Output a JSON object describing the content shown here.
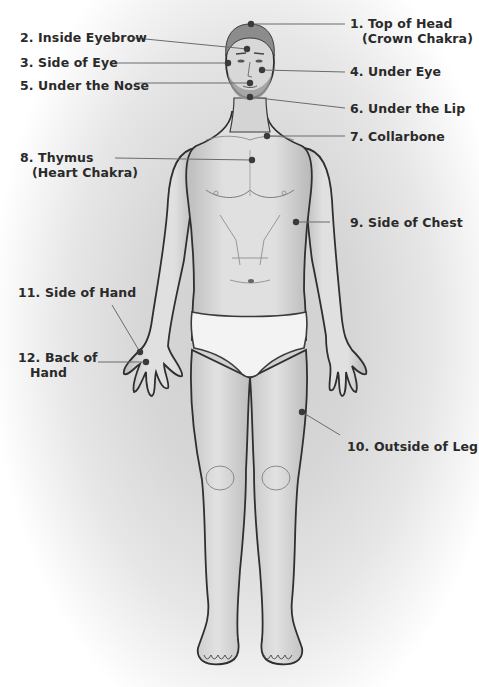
{
  "diagram": {
    "colors": {
      "line": "#6b6b6b",
      "dot": "#3a3a3a",
      "text": "#2a2a2a",
      "outline": "#2f2f2f",
      "skin": "#d9d9d9",
      "underwear": "#f2f2f2"
    },
    "points": [
      {
        "id": "top-of-head",
        "label": "1. Top of Head",
        "sub": "(Crown Chakra)",
        "side": "right",
        "label_x": 350,
        "label_y": 16,
        "dot_x": 251,
        "dot_y": 24,
        "line_to_x": 345,
        "line_to_y": 24
      },
      {
        "id": "inside-eyebrow",
        "label": "2. Inside Eyebrow",
        "sub": "",
        "side": "left",
        "label_x": 20,
        "label_y": 30,
        "dot_x": 247,
        "dot_y": 49,
        "line_from_x": 135,
        "line_from_y": 38
      },
      {
        "id": "side-of-eye",
        "label": "3. Side of Eye",
        "sub": "",
        "side": "left",
        "label_x": 20,
        "label_y": 55,
        "dot_x": 228,
        "dot_y": 63,
        "line_from_x": 110,
        "line_from_y": 63
      },
      {
        "id": "under-eye",
        "label": "4. Under Eye",
        "sub": "",
        "side": "right",
        "label_x": 350,
        "label_y": 64,
        "dot_x": 262,
        "dot_y": 70,
        "line_to_x": 345,
        "line_to_y": 72
      },
      {
        "id": "under-the-nose",
        "label": "5. Under the Nose",
        "sub": "",
        "side": "left",
        "label_x": 20,
        "label_y": 78,
        "dot_x": 250,
        "dot_y": 83,
        "line_from_x": 135,
        "line_from_y": 83
      },
      {
        "id": "under-the-lip",
        "label": "6. Under the Lip",
        "sub": "",
        "side": "right",
        "label_x": 350,
        "label_y": 101,
        "dot_x": 250,
        "dot_y": 97,
        "line_to_x": 345,
        "line_to_y": 108
      },
      {
        "id": "collarbone",
        "label": "7. Collarbone",
        "sub": "",
        "side": "right",
        "label_x": 350,
        "label_y": 129,
        "dot_x": 267,
        "dot_y": 136,
        "line_to_x": 345,
        "line_to_y": 136
      },
      {
        "id": "thymus",
        "label": "8. Thymus",
        "sub": "(Heart Chakra)",
        "side": "left",
        "label_x": 20,
        "label_y": 150,
        "dot_x": 252,
        "dot_y": 160,
        "line_from_x": 115,
        "line_from_y": 158
      },
      {
        "id": "side-of-chest",
        "label": "9. Side of Chest",
        "sub": "",
        "side": "right",
        "label_x": 350,
        "label_y": 215,
        "dot_x": 296,
        "dot_y": 222,
        "line_to_x": 330,
        "line_to_y": 222
      },
      {
        "id": "outside-of-leg",
        "label": "10. Outside of Leg",
        "sub": "",
        "side": "right",
        "label_x": 347,
        "label_y": 439,
        "dot_x": 302,
        "dot_y": 412,
        "line_to_x": 340,
        "line_to_y": 435
      },
      {
        "id": "side-of-hand",
        "label": "11. Side of Hand",
        "sub": "",
        "side": "left",
        "label_x": 18,
        "label_y": 285,
        "dot_x": 140,
        "dot_y": 352,
        "line_from_x": 112,
        "line_from_y": 305
      },
      {
        "id": "back-of-hand",
        "label": "12. Back of",
        "sub": "Hand",
        "side": "left",
        "label_x": 18,
        "label_y": 350,
        "dot_x": 146,
        "dot_y": 362,
        "line_from_x": 98,
        "line_from_y": 362
      }
    ]
  }
}
